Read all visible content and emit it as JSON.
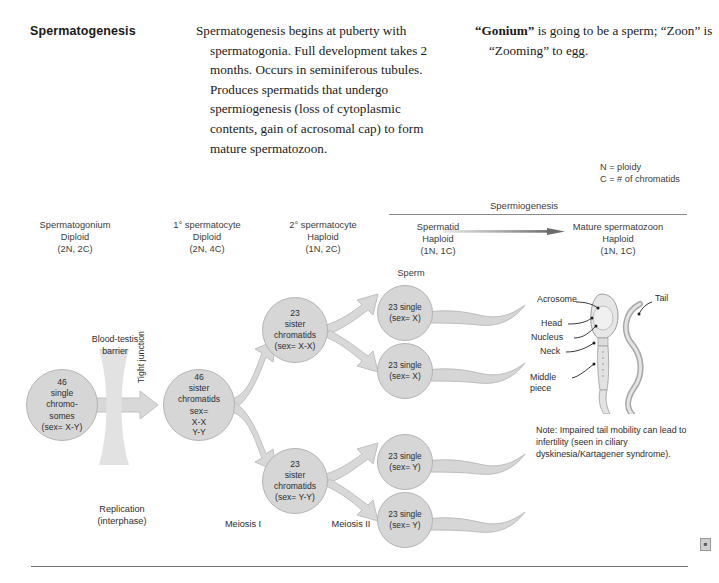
{
  "topic": {
    "title": "Spermatogenesis"
  },
  "description": "Spermatogenesis begins at puberty with spermatogonia. Full development takes 2 months. Occurs in seminiferous tubules. Produces spermatids that undergo spermiogenesis (loss of cytoplasmic contents, gain of acrosomal cap) to form mature spermatozoon.",
  "mnemonic": {
    "bold_term": "“Gonium”",
    "rest": " is going to be a sperm; “Zoon” is “Zooming” to egg."
  },
  "legend": {
    "ploidy": "N = ploidy",
    "chromatids": "C = # of chromatids"
  },
  "spermiogenesis": {
    "label": "Spermiogenesis"
  },
  "stage_headers": [
    {
      "name": "Spermatogonium",
      "ploidy": "Diploid",
      "notation": "(2N, 2C)"
    },
    {
      "name": "1° spermatocyte",
      "ploidy": "Diploid",
      "notation": "(2N, 4C)"
    },
    {
      "name": "2° spermatocyte",
      "ploidy": "Haploid",
      "notation": "(1N, 2C)"
    },
    {
      "name": "Spermatid",
      "ploidy": "Haploid",
      "notation": "(1N, 1C)"
    },
    {
      "name": "Mature spermatozoon",
      "ploidy": "Haploid",
      "notation": "(1N, 1C)"
    }
  ],
  "cells": {
    "spermatogonium": {
      "count": "46",
      "line2": "single",
      "line3": "chromo-",
      "line4": "somes",
      "sex": "(sex= X-Y)"
    },
    "primary": {
      "count": "46",
      "line2": "sister",
      "line3": "chromatids",
      "sex_prefix": "sex=",
      "sex_top": "X-X",
      "sex_bottom": "Y-Y"
    },
    "secondary_x": {
      "count": "23",
      "line2": "sister",
      "line3": "chromatids",
      "sex": "(sex= X-X)"
    },
    "secondary_y": {
      "count": "23",
      "line2": "sister",
      "line3": "chromatids",
      "sex": "(sex= Y-Y)"
    }
  },
  "sperm_label": "Sperm",
  "spermatids": [
    {
      "count": "23",
      "line2": "single",
      "sex": "(sex= X)"
    },
    {
      "count": "23",
      "line2": "single",
      "sex": "(sex= X)"
    },
    {
      "count": "23",
      "line2": "single",
      "sex": "(sex= Y)"
    },
    {
      "count": "23",
      "line2": "single",
      "sex": "(sex= Y)"
    }
  ],
  "barrier": {
    "label_line1": "Blood-testis",
    "label_line2": "barrier",
    "tight_junction": "Tight junction"
  },
  "process_labels": {
    "replication_line1": "Replication",
    "replication_line2": "(interphase)",
    "meiosis1": "Meiosis I",
    "meiosis2": "Meiosis II"
  },
  "anatomy": {
    "acrosome": "Acrosome",
    "head": "Head",
    "nucleus": "Nucleus",
    "neck": "Neck",
    "middle_line1": "Middle",
    "middle_line2": "piece",
    "tail": "Tail"
  },
  "note": "Note: Impaired tail mobility can lead to infertility (seen in ciliary dyskinesia/Kartagener syndrome).",
  "colors": {
    "cell_fill": "#d6d6d6",
    "cell_stroke": "#b4b4b4",
    "arrow_fill": "#d2d2d2",
    "text": "#2d2d2d"
  }
}
